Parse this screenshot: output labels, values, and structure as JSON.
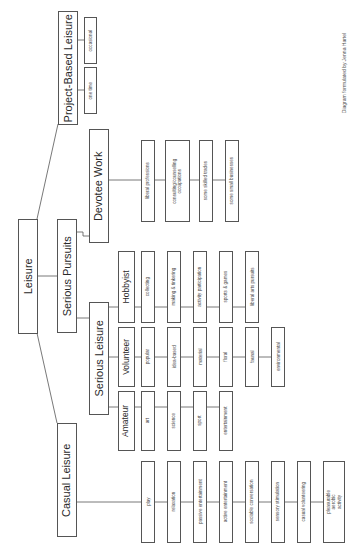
{
  "diagram": {
    "root": {
      "label": "Leisure"
    },
    "project_based": {
      "label": "Project-Based Leisure",
      "children": [
        "occasional",
        "one time"
      ]
    },
    "serious_pursuits": {
      "label": "Serious Pursuits",
      "devotee_work": {
        "label": "Devotee Work",
        "children": [
          "liberal professions",
          "consulting/counselling occupations",
          "some skilled trades",
          "some small businesses"
        ]
      },
      "serious_leisure": {
        "label": "Serious Leisure",
        "hobbyist": {
          "label": "Hobbyist",
          "children": [
            "collecting",
            "making & tinkering",
            "activity participation",
            "sports & games",
            "liberal arts pursuits"
          ]
        },
        "volunteer": {
          "label": "Volunteer",
          "children": [
            "popular",
            "idea-based",
            "material",
            "floral",
            "faunal",
            "environmental"
          ]
        },
        "amateur": {
          "label": "Amateur",
          "children": [
            "art",
            "science",
            "sport",
            "entertainment"
          ]
        }
      }
    },
    "casual": {
      "label": "Casual Leisure",
      "children": [
        "play",
        "relaxation",
        "passive entertainment",
        "active entertainment",
        "sociable conversation",
        "sensory stimulation",
        "casual volunteering",
        "pleasurable aerobic activity"
      ]
    },
    "credit": "Diagram formulated by Jenna Hartel"
  }
}
